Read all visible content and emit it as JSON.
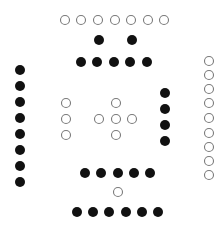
{
  "diagram": {
    "title": "",
    "colors": {
      "background": "#ffffff",
      "filled": "#111111",
      "open_stroke": "#7a7a7a"
    },
    "radii": {
      "filled": 5,
      "open": 4.5
    },
    "groups": [
      {
        "name": "top-open-row",
        "type": "open",
        "points": [
          [
            65,
            20
          ],
          [
            81,
            20
          ],
          [
            98,
            20
          ],
          [
            115,
            20
          ],
          [
            131,
            20
          ],
          [
            148,
            20
          ],
          [
            164,
            20
          ]
        ]
      },
      {
        "name": "top-filled-pair",
        "type": "filled",
        "points": [
          [
            99,
            40
          ],
          [
            132,
            40
          ]
        ]
      },
      {
        "name": "upper-filled-row",
        "type": "filled",
        "points": [
          [
            81,
            62
          ],
          [
            97,
            62
          ],
          [
            114,
            62
          ],
          [
            130,
            62
          ],
          [
            147,
            62
          ]
        ]
      },
      {
        "name": "left-filled-column",
        "type": "filled",
        "points": [
          [
            20,
            70
          ],
          [
            20,
            86
          ],
          [
            20,
            102
          ],
          [
            20,
            118
          ],
          [
            20,
            134
          ],
          [
            20,
            150
          ],
          [
            20,
            166
          ],
          [
            20,
            182
          ]
        ]
      },
      {
        "name": "middle-left-open-column",
        "type": "open",
        "points": [
          [
            66,
            103
          ],
          [
            66,
            119
          ],
          [
            66,
            135
          ]
        ]
      },
      {
        "name": "center-open-plus",
        "type": "open",
        "points": [
          [
            116,
            103
          ],
          [
            99,
            119
          ],
          [
            116,
            119
          ],
          [
            132,
            119
          ],
          [
            116,
            135
          ]
        ]
      },
      {
        "name": "right-filled-column",
        "type": "filled",
        "points": [
          [
            165,
            93
          ],
          [
            165,
            109
          ],
          [
            165,
            125
          ],
          [
            165,
            141
          ]
        ]
      },
      {
        "name": "right-open-column",
        "type": "open",
        "points": [
          [
            209,
            61
          ],
          [
            209,
            75
          ],
          [
            209,
            89
          ],
          [
            209,
            103
          ],
          [
            209,
            118
          ],
          [
            209,
            133
          ],
          [
            209,
            147
          ],
          [
            209,
            161
          ],
          [
            209,
            175
          ]
        ]
      },
      {
        "name": "lower-filled-row",
        "type": "filled",
        "points": [
          [
            85,
            173
          ],
          [
            101,
            173
          ],
          [
            118,
            173
          ],
          [
            134,
            173
          ],
          [
            150,
            173
          ]
        ]
      },
      {
        "name": "bottom-single-open",
        "type": "open",
        "points": [
          [
            118,
            192
          ]
        ]
      },
      {
        "name": "bottom-filled-row",
        "type": "filled",
        "points": [
          [
            77,
            212
          ],
          [
            93,
            212
          ],
          [
            109,
            212
          ],
          [
            126,
            212
          ],
          [
            142,
            212
          ],
          [
            158,
            212
          ]
        ]
      }
    ]
  }
}
